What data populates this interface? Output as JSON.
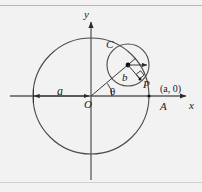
{
  "figure": {
    "name": "rolling-circle-epicycloid-diagram",
    "background_color": "#f2f2f2",
    "stroke_color": "#3a3a3a",
    "label_color": "#1a1a1a"
  },
  "axes": {
    "x_label": "x",
    "y_label": "y",
    "origin_label": "O"
  },
  "points": {
    "A_label": "A",
    "A_coordinate_label": "(a, 0)",
    "P_label": "P",
    "C_label": "C"
  },
  "measures": {
    "outer_radius_label": "a",
    "inner_radius_label": "b",
    "angle_label": "θ"
  },
  "geometry": {
    "origin": {
      "x": 91,
      "y": 96
    },
    "outer_circle_radius": 58,
    "inner_circle": {
      "cx": 128,
      "cy": 65,
      "r": 21
    },
    "point_A": {
      "x": 149,
      "y": 96
    },
    "point_P": {
      "x": 140,
      "y": 78
    },
    "theta_degrees": 40
  }
}
